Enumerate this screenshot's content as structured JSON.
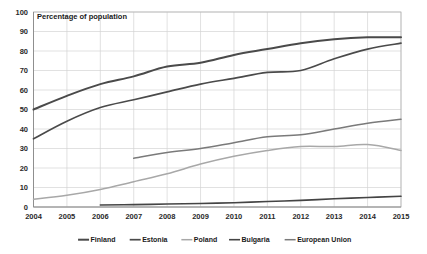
{
  "chart_data": {
    "type": "line",
    "title": "",
    "annotation": "Percentage of population",
    "xlabel": "",
    "ylabel": "",
    "ylim": [
      0,
      100
    ],
    "ytick_step": 10,
    "yticks": [
      "0",
      "10",
      "20",
      "30",
      "40",
      "50",
      "60",
      "70",
      "80",
      "90",
      "100"
    ],
    "categories": [
      "2004",
      "2005",
      "2006",
      "2007",
      "2008",
      "2009",
      "2010",
      "2011",
      "2012",
      "2013",
      "2014",
      "2015"
    ],
    "x": [
      2004,
      2005,
      2006,
      2007,
      2008,
      2009,
      2010,
      2011,
      2012,
      2013,
      2014,
      2015
    ],
    "grid": true,
    "legend_position": "bottom",
    "series": [
      {
        "name": "Finland",
        "color": "#4a4a4a",
        "width": 2.0,
        "values": [
          50,
          57,
          63,
          67,
          72,
          74,
          78,
          81,
          84,
          86,
          87,
          87
        ]
      },
      {
        "name": "Estonia",
        "color": "#4a4a4a",
        "width": 1.7,
        "values": [
          35,
          44,
          51,
          55,
          59,
          63,
          66,
          69,
          70,
          76,
          81,
          84
        ]
      },
      {
        "name": "Poland",
        "color": "#a8a8a8",
        "width": 1.5,
        "values": [
          4,
          6,
          9,
          13,
          17,
          22,
          26,
          29,
          31,
          31,
          32,
          29
        ]
      },
      {
        "name": "Bulgaria",
        "color": "#444444",
        "width": 1.6,
        "values": [
          null,
          null,
          1.0,
          1.2,
          1.5,
          1.8,
          2.2,
          2.8,
          3.4,
          4.2,
          4.9,
          5.5
        ]
      },
      {
        "name": "European Union",
        "color": "#7a7a7a",
        "width": 1.5,
        "values": [
          null,
          null,
          null,
          25,
          28,
          30,
          33,
          36,
          37,
          40,
          43,
          45
        ]
      }
    ]
  },
  "legend": {
    "items": [
      {
        "label": "Finland",
        "color": "#4a4a4a",
        "width": 2.0
      },
      {
        "label": "Estonia",
        "color": "#4a4a4a",
        "width": 1.7
      },
      {
        "label": "Poland",
        "color": "#a8a8a8",
        "width": 1.5
      },
      {
        "label": "Bulgaria",
        "color": "#444444",
        "width": 1.6
      },
      {
        "label": "European Union",
        "color": "#7a7a7a",
        "width": 1.5
      }
    ]
  },
  "colors": {
    "background": "#ffffff",
    "grid": "#d4d4d4",
    "axis": "#8a8a8a",
    "text": "#1a1a1a"
  }
}
